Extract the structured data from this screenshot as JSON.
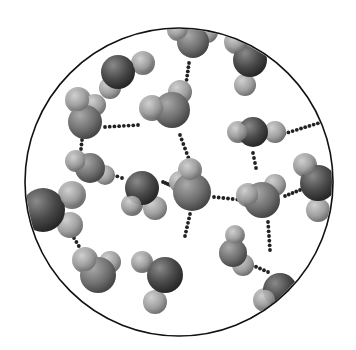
{
  "figure": {
    "frame": {
      "cx": 179,
      "cy": 182,
      "r": 154,
      "stroke": "#111111"
    },
    "colors": {
      "background": "#ffffff",
      "oxygen_dark": "#3a3a3a",
      "oxygen_mid": "#6e6e6e",
      "hydrogen_light": "#a8a8a8",
      "bond_dot": "#222222"
    },
    "molecules": [
      {
        "id": "m1",
        "o": [
          118,
          72,
          17
        ],
        "h": [
          [
            143,
            63,
            12
          ],
          [
            110,
            88,
            11
          ]
        ],
        "tone": "dark"
      },
      {
        "id": "m2",
        "o": [
          193,
          42,
          16
        ],
        "h": [
          [
            178,
            30,
            11
          ],
          [
            207,
            32,
            11
          ]
        ],
        "tone": "mid"
      },
      {
        "id": "m3",
        "o": [
          250,
          60,
          17
        ],
        "h": [
          [
            236,
            42,
            12
          ],
          [
            245,
            85,
            11
          ]
        ],
        "tone": "dark"
      },
      {
        "id": "m4",
        "o": [
          85,
          122,
          17
        ],
        "h": [
          [
            78,
            100,
            13
          ],
          [
            95,
            105,
            11
          ]
        ],
        "tone": "mid"
      },
      {
        "id": "m5",
        "o": [
          172,
          110,
          18
        ],
        "h": [
          [
            152,
            108,
            13
          ],
          [
            180,
            92,
            12
          ]
        ],
        "tone": "mid"
      },
      {
        "id": "m6",
        "o": [
          253,
          132,
          15
        ],
        "h": [
          [
            238,
            132,
            11
          ],
          [
            275,
            132,
            11
          ]
        ],
        "tone": "dark"
      },
      {
        "id": "m7",
        "o": [
          90,
          168,
          15
        ],
        "h": [
          [
            76,
            161,
            11
          ],
          [
            105,
            175,
            10
          ]
        ],
        "tone": "mid"
      },
      {
        "id": "m8",
        "o": [
          142,
          188,
          17
        ],
        "h": [
          [
            132,
            205,
            11
          ],
          [
            155,
            208,
            12
          ]
        ],
        "tone": "dark"
      },
      {
        "id": "m9",
        "o": [
          192,
          192,
          19
        ],
        "h": [
          [
            190,
            170,
            12
          ],
          [
            180,
            182,
            11
          ]
        ],
        "tone": "mid"
      },
      {
        "id": "m10",
        "o": [
          262,
          200,
          18
        ],
        "h": [
          [
            248,
            195,
            12
          ],
          [
            275,
            185,
            11
          ]
        ],
        "tone": "mid"
      },
      {
        "id": "m11",
        "o": [
          318,
          183,
          18
        ],
        "h": [
          [
            305,
            165,
            12
          ],
          [
            318,
            210,
            12
          ]
        ],
        "tone": "dark"
      },
      {
        "id": "m12",
        "o": [
          43,
          210,
          22
        ],
        "h": [
          [
            72,
            195,
            14
          ],
          [
            70,
            225,
            13
          ]
        ],
        "tone": "dark"
      },
      {
        "id": "m13",
        "o": [
          98,
          275,
          18
        ],
        "h": [
          [
            85,
            260,
            13
          ],
          [
            110,
            262,
            11
          ]
        ],
        "tone": "mid"
      },
      {
        "id": "m14",
        "o": [
          165,
          275,
          18
        ],
        "h": [
          [
            142,
            262,
            11
          ],
          [
            155,
            302,
            12
          ]
        ],
        "tone": "dark"
      },
      {
        "id": "m15",
        "o": [
          233,
          253,
          14
        ],
        "h": [
          [
            235,
            235,
            10
          ],
          [
            243,
            265,
            11
          ]
        ],
        "tone": "mid"
      },
      {
        "id": "m16",
        "o": [
          280,
          290,
          17
        ],
        "h": [
          [
            265,
            300,
            12
          ],
          [
            295,
            300,
            12
          ]
        ],
        "tone": "dark"
      }
    ],
    "hbonds": [
      {
        "from": [
          189,
          63
        ],
        "to": [
          186,
          84
        ]
      },
      {
        "from": [
          105,
          127
        ],
        "to": [
          138,
          125
        ]
      },
      {
        "from": [
          180,
          135
        ],
        "to": [
          190,
          162
        ]
      },
      {
        "from": [
          82,
          140
        ],
        "to": [
          80,
          158
        ]
      },
      {
        "from": [
          108,
          173
        ],
        "to": [
          122,
          178
        ]
      },
      {
        "from": [
          163,
          182
        ],
        "to": [
          170,
          185
        ]
      },
      {
        "from": [
          214,
          197
        ],
        "to": [
          242,
          200
        ]
      },
      {
        "from": [
          253,
          153
        ],
        "to": [
          256,
          168
        ]
      },
      {
        "from": [
          280,
          135
        ],
        "to": [
          322,
          122
        ]
      },
      {
        "from": [
          285,
          196
        ],
        "to": [
          300,
          190
        ]
      },
      {
        "from": [
          190,
          214
        ],
        "to": [
          185,
          236
        ]
      },
      {
        "from": [
          74,
          238
        ],
        "to": [
          86,
          258
        ]
      },
      {
        "from": [
          268,
          222
        ],
        "to": [
          270,
          250
        ]
      },
      {
        "from": [
          252,
          265
        ],
        "to": [
          268,
          272
        ]
      }
    ]
  }
}
